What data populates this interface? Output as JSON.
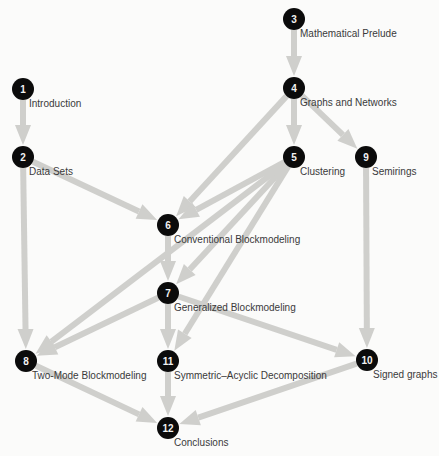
{
  "diagram": {
    "edge_color": "#cfcfcc",
    "node_color": "#0b0b0b",
    "nodes": [
      {
        "id": "1",
        "label": "Introduction",
        "x": 23,
        "y": 89
      },
      {
        "id": "2",
        "label": "Data Sets",
        "x": 23,
        "y": 157
      },
      {
        "id": "3",
        "label": "Mathematical Prelude",
        "x": 294,
        "y": 19
      },
      {
        "id": "4",
        "label": "Graphs and Networks",
        "x": 294,
        "y": 88
      },
      {
        "id": "5",
        "label": "Clustering",
        "x": 294,
        "y": 157
      },
      {
        "id": "6",
        "label": "Conventional Blockmodeling",
        "x": 168,
        "y": 225
      },
      {
        "id": "7",
        "label": "Generalized Blockmodeling",
        "x": 168,
        "y": 293
      },
      {
        "id": "8",
        "label": "Two-Mode Blockmodeling",
        "x": 26,
        "y": 361
      },
      {
        "id": "9",
        "label": "Semirings",
        "x": 366,
        "y": 157
      },
      {
        "id": "10",
        "label": "Signed graphs",
        "x": 367,
        "y": 360
      },
      {
        "id": "11",
        "label": "Symmetric–Acyclic Decomposition",
        "x": 168,
        "y": 361
      },
      {
        "id": "12",
        "label": "Conclusions",
        "x": 168,
        "y": 428
      }
    ],
    "edges": [
      [
        "1",
        "2"
      ],
      [
        "2",
        "6"
      ],
      [
        "2",
        "8"
      ],
      [
        "3",
        "4"
      ],
      [
        "4",
        "5"
      ],
      [
        "4",
        "9"
      ],
      [
        "4",
        "6"
      ],
      [
        "5",
        "6"
      ],
      [
        "5",
        "7"
      ],
      [
        "5",
        "8"
      ],
      [
        "5",
        "11"
      ],
      [
        "6",
        "7"
      ],
      [
        "7",
        "8"
      ],
      [
        "7",
        "11"
      ],
      [
        "7",
        "10"
      ],
      [
        "9",
        "10"
      ],
      [
        "8",
        "12"
      ],
      [
        "11",
        "12"
      ],
      [
        "10",
        "12"
      ]
    ]
  }
}
